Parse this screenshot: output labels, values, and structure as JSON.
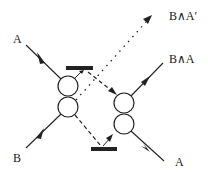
{
  "diagram": {
    "type": "logic-gate-schematic",
    "colors": {
      "stroke": "#222222",
      "background": "#ffffff"
    },
    "labels": {
      "input_a": "A",
      "input_b": "B",
      "output_b_and_not_a": "B∧A′",
      "output_b_and_a": "B∧A",
      "output_a": "A"
    },
    "nodes": [
      {
        "id": "left-gate-top-circle",
        "shape": "circle"
      },
      {
        "id": "left-gate-bottom-circle",
        "shape": "circle"
      },
      {
        "id": "right-gate-top-circle",
        "shape": "circle"
      },
      {
        "id": "right-gate-bottom-circle",
        "shape": "circle"
      },
      {
        "id": "top-bar",
        "shape": "bar"
      },
      {
        "id": "bottom-bar",
        "shape": "bar"
      }
    ],
    "edges": [
      {
        "from": "A",
        "to": "left-gate-top-circle",
        "style": "solid"
      },
      {
        "from": "B",
        "to": "left-gate-bottom-circle",
        "style": "solid"
      },
      {
        "from": "left-gate",
        "to": "B∧A′",
        "style": "dotted"
      },
      {
        "from": "top-bar",
        "to": "right-gate-top-circle",
        "style": "dashed"
      },
      {
        "from": "left-gate-bottom-circle",
        "to": "bottom-bar",
        "style": "dashed"
      },
      {
        "from": "right-gate-top-circle",
        "to": "B∧A",
        "style": "solid"
      },
      {
        "from": "right-gate-bottom-circle",
        "to": "A",
        "style": "solid"
      }
    ]
  }
}
